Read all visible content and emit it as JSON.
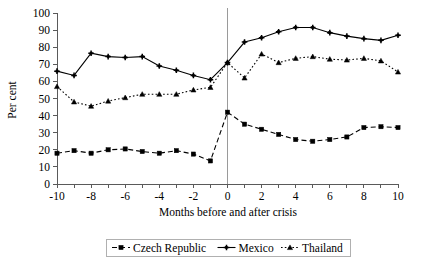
{
  "chart_data": {
    "type": "line",
    "title": "",
    "xlabel": "Months before and after crisis",
    "ylabel": "Per cent",
    "xlim": [
      -10,
      10
    ],
    "ylim": [
      0,
      100
    ],
    "ytick_step": 10,
    "xtick_step": 2,
    "xtick_minor_step": 1,
    "grid": false,
    "legend_position": "bottom",
    "annotations": [
      {
        "name": "crisis-marker",
        "type": "vertical-line",
        "x": 0,
        "label": ""
      }
    ],
    "x": [
      -10,
      -9,
      -8,
      -7,
      -6,
      -5,
      -4,
      -3,
      -2,
      -1,
      0,
      1,
      2,
      3,
      4,
      5,
      6,
      7,
      8,
      9,
      10
    ],
    "xtick_labels": [
      "-10",
      "-8",
      "-6",
      "-4",
      "-2",
      "0",
      "2",
      "4",
      "6",
      "8",
      "10"
    ],
    "ytick_labels": [
      "0",
      "10",
      "20",
      "30",
      "40",
      "50",
      "60",
      "70",
      "80",
      "90",
      "100"
    ],
    "series": [
      {
        "name": "Czech Republic",
        "marker": "square",
        "linestyle": "dashed",
        "color": "#000000",
        "values": [
          18,
          19.5,
          18,
          20,
          20.5,
          19,
          18,
          19.5,
          17.5,
          13.5,
          42,
          35,
          32,
          29,
          26,
          25,
          26,
          27.5,
          33,
          33.5,
          33
        ]
      },
      {
        "name": "Mexico",
        "marker": "cross",
        "linestyle": "solid",
        "color": "#000000",
        "values": [
          66,
          63.5,
          76.5,
          74.5,
          74,
          74.5,
          69,
          66.5,
          63.5,
          61,
          71,
          83,
          85.5,
          89,
          91.5,
          91.5,
          88.5,
          86.5,
          85,
          84,
          87
        ]
      },
      {
        "name": "Thailand",
        "marker": "triangle",
        "linestyle": "dotted",
        "color": "#000000",
        "values": [
          57,
          48,
          45.5,
          48.5,
          50.5,
          52.5,
          52.5,
          52.5,
          55,
          56.5,
          71,
          62,
          76,
          71,
          73.5,
          74.5,
          73,
          72.5,
          73.5,
          72,
          65.5
        ]
      }
    ]
  },
  "legend": {
    "entries": [
      {
        "label": "Czech Republic"
      },
      {
        "label": "Mexico"
      },
      {
        "label": "Thailand"
      }
    ]
  }
}
